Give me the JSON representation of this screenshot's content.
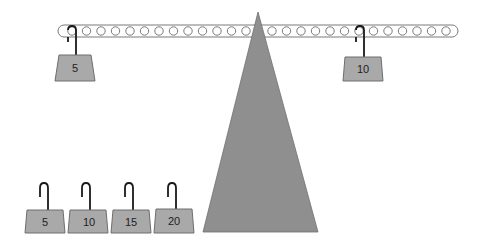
{
  "scene": {
    "title": "Balance beam with weights",
    "colors": {
      "fulcrum": "#8f8f8f",
      "weight_fill": "#a9a9a9",
      "weight_stroke": "#6e6e6e",
      "beam_stroke": "#7a7a7a",
      "hook": "#1a1a1a"
    }
  },
  "beam": {
    "holes_left": 13,
    "holes_right": 13
  },
  "hung_weights": [
    {
      "label": "5",
      "side": "left",
      "hole": 13
    },
    {
      "label": "10",
      "side": "right",
      "hole": 7
    }
  ],
  "tray_weights": [
    {
      "label": "5"
    },
    {
      "label": "10"
    },
    {
      "label": "15"
    },
    {
      "label": "20"
    }
  ]
}
